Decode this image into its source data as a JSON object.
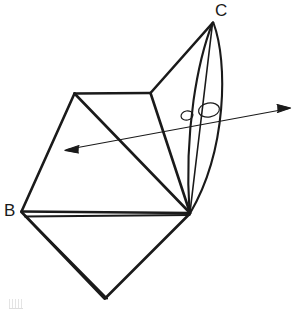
{
  "figure": {
    "kind": "line-drawing",
    "canvas": {
      "width": 293,
      "height": 309
    },
    "background_color": "#ffffff",
    "stroke_color": "#1a1a1a",
    "labels": [
      {
        "id": "C",
        "text": "C",
        "x": 215,
        "y": 2
      },
      {
        "id": "B",
        "text": "B",
        "x": 4,
        "y": 202
      }
    ],
    "vertices": {
      "C": {
        "x": 213,
        "y": 22
      },
      "B": {
        "x": 21,
        "y": 211
      },
      "top_left": {
        "x": 74,
        "y": 93
      },
      "top_right": {
        "x": 150,
        "y": 93
      },
      "right": {
        "x": 190,
        "y": 213
      },
      "bottom": {
        "x": 104,
        "y": 298
      }
    },
    "axis_arrow": {
      "name": "rotation-axis-arrow",
      "left_tip": {
        "x": 65,
        "y": 150
      },
      "right_tip": {
        "x": 290,
        "y": 108
      },
      "double_headed": true
    },
    "axis_loops": [
      {
        "cx": 187,
        "cy": 115,
        "rx": 6,
        "ry": 4.5
      },
      {
        "cx": 209,
        "cy": 110,
        "rx": 10,
        "ry": 7
      }
    ],
    "lens": {
      "name": "curved-lens-surface",
      "apex": {
        "x": 213,
        "y": 22
      },
      "base": {
        "x": 190,
        "y": 213
      },
      "left_arc_bulge_x": 183,
      "right_arc_bulge_x": 224
    }
  }
}
